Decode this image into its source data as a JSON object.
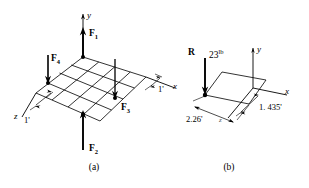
{
  "figure": {
    "type": "engineering-diagram",
    "panels": [
      {
        "id": "a",
        "caption": "(a)",
        "axes": [
          {
            "name": "y-axis-label",
            "label": "y"
          },
          {
            "name": "x-axis-label",
            "label": "x"
          },
          {
            "name": "z-axis-label",
            "label": "z"
          }
        ],
        "forces": [
          {
            "name": "F1",
            "label": "F",
            "subscript": "1",
            "direction": "up"
          },
          {
            "name": "F2",
            "label": "F",
            "subscript": "2",
            "direction": "up"
          },
          {
            "name": "F3",
            "label": "F",
            "subscript": "3",
            "direction": "down"
          },
          {
            "name": "F4",
            "label": "F",
            "subscript": "4",
            "direction": "down"
          }
        ],
        "dimensions": [
          {
            "name": "grid-spacing-z",
            "label": "1'"
          },
          {
            "name": "grid-spacing-x",
            "label": "1'"
          }
        ],
        "grid": {
          "rows": 4,
          "cols": 4
        }
      },
      {
        "id": "b",
        "caption": "(b)",
        "axes": [
          {
            "name": "y-axis-label",
            "label": "y"
          },
          {
            "name": "x-axis-label",
            "label": "x"
          },
          {
            "name": "z-axis-label",
            "label": "z"
          }
        ],
        "forces": [
          {
            "name": "R",
            "label": "R",
            "magnitude": "23",
            "unit": "lb",
            "direction": "down"
          }
        ],
        "dimensions": [
          {
            "name": "distance-z",
            "label": "2.26'"
          },
          {
            "name": "distance-x",
            "label": "1. 435'"
          }
        ]
      }
    ],
    "colors": {
      "ink": "#000000",
      "background": "#ffffff",
      "faint": "#555555"
    }
  }
}
